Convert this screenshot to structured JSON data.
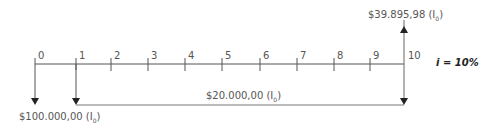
{
  "diagram": {
    "type": "cash-flow-timeline",
    "periods": [
      "0",
      "1",
      "2",
      "3",
      "4",
      "5",
      "6",
      "7",
      "8",
      "9",
      "10"
    ],
    "tick_x": [
      35,
      76,
      111,
      148,
      185,
      222,
      260,
      297,
      334,
      370,
      404
    ],
    "axis_y": 64,
    "interest_rate": "i = 10%",
    "flows": {
      "initial_investment": {
        "amount": "$100.000,00",
        "suffix": "(I",
        "sub": "0",
        "close": ")",
        "period": "0",
        "direction": "down"
      },
      "annuity": {
        "amount": "$20.000,00",
        "suffix": "(I",
        "sub": "0",
        "close": ")",
        "from_period": "1",
        "to_period": "10",
        "direction": "down"
      },
      "final_value": {
        "amount": "$39.895,98",
        "suffix": "(I",
        "sub": "0",
        "close": ")",
        "period": "10",
        "direction": "up"
      }
    }
  }
}
